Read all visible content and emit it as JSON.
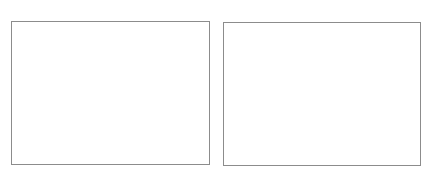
{
  "panels": [
    {
      "id": "left",
      "label": "",
      "border_color": "#8c8c8c",
      "fill": "#ffffff"
    },
    {
      "id": "right",
      "label": "",
      "border_color": "#8c8c8c",
      "fill": "#ffffff"
    }
  ]
}
